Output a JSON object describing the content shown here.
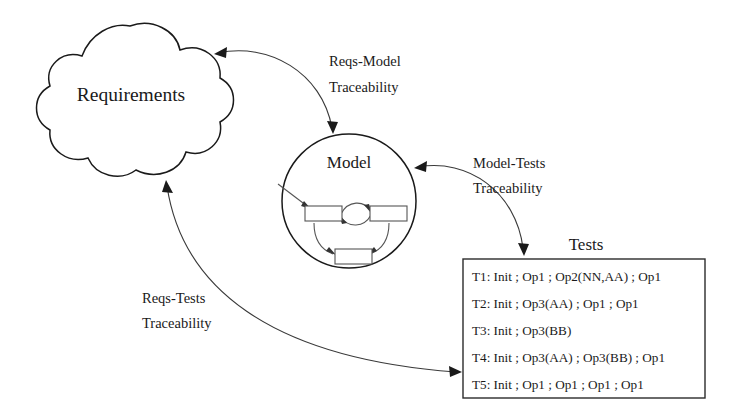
{
  "diagram": {
    "background_color": "#ffffff",
    "line_color": "#1a1a1a",
    "nodes": {
      "requirements": {
        "label": "Requirements",
        "shape": "cloud"
      },
      "model": {
        "label": "Model",
        "shape": "circle",
        "inner_machine": {
          "states": [
            "state-left",
            "state-right",
            "state-bottom"
          ],
          "transitions": [
            "left-to-right",
            "right-to-left",
            "left-to-bottom",
            "right-to-bottom"
          ]
        }
      },
      "tests": {
        "label": "Tests",
        "shape": "rectangle",
        "lines": [
          "T1: Init ; Op1 ; Op2(NN,AA) ; Op1",
          "T2: Init ; Op3(AA) ; Op1 ; Op1",
          "T3: Init ; Op3(BB)",
          "T4: Init ; Op3(AA) ; Op3(BB) ; Op1",
          "T5: Init ; Op1 ; Op1 ; Op1 ; Op1"
        ]
      }
    },
    "edges": [
      {
        "id": "reqs-model",
        "label_line1": "Reqs-Model",
        "label_line2": "Traceability",
        "from": "requirements",
        "to": "model",
        "arrows": "both"
      },
      {
        "id": "model-tests",
        "label_line1": "Model-Tests",
        "label_line2": "Traceability",
        "from": "model",
        "to": "tests",
        "arrows": "both"
      },
      {
        "id": "reqs-tests",
        "label_line1": "Reqs-Tests",
        "label_line2": "Traceability",
        "from": "requirements",
        "to": "tests",
        "arrows": "both"
      }
    ]
  }
}
